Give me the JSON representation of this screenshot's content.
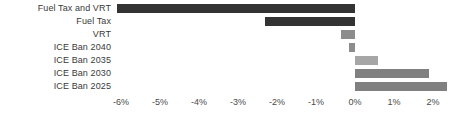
{
  "chart_data": {
    "type": "bar",
    "orientation": "horizontal",
    "title": "",
    "xlabel": "",
    "ylabel": "",
    "categories": [
      "Fuel Tax and VRT",
      "Fuel Tax",
      "VRT",
      "ICE Ban 2040",
      "ICE Ban 2035",
      "ICE Ban 2030",
      "ICE Ban 2025"
    ],
    "values": [
      -6.1,
      -2.3,
      -0.35,
      -0.15,
      0.6,
      1.9,
      2.35
    ],
    "value_labels": [
      "-6.1%",
      "-2.3%",
      "-0.35%",
      "-0.15%",
      "0.6%",
      "1.9%",
      "2.35%"
    ],
    "bar_colors": [
      "#333333",
      "#333333",
      "#8c8c8c",
      "#8c8c8c",
      "#a6a6a6",
      "#808080",
      "#808080"
    ],
    "xlim": [
      -6.45,
      2.7
    ],
    "xticks": [
      -6,
      -5,
      -4,
      -3,
      -2,
      -1,
      0,
      1,
      2
    ],
    "xtick_labels": [
      "-6%",
      "-5%",
      "-4%",
      "-3%",
      "-2%",
      "-1%",
      "0%",
      "1%",
      "2%"
    ],
    "grid": false,
    "legend": null,
    "zero_line_value": 0
  },
  "axis": {
    "tick_labels": [
      "-6%",
      "-5%",
      "-4%",
      "-3%",
      "-2%",
      "-1%",
      "0%",
      "1%",
      "2%"
    ]
  }
}
